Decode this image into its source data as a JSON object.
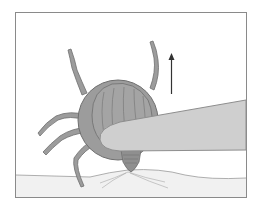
{
  "illustration": {
    "subject": "tick-removal-with-tweezers",
    "elements": [
      "frame",
      "skin-surface",
      "tick",
      "tweezers",
      "pull-direction-arrow"
    ],
    "colors": {
      "background": "#ffffff",
      "frame_border": "#8a8a8a",
      "skin": "#f1f1f1",
      "skin_line": "#9a9a9a",
      "tick_body": "#9c9c9c",
      "tick_outline": "#6e6e6e",
      "tweezers": "#cfcfcf",
      "tweezers_outline": "#8e8e8e",
      "arrow": "#333333"
    },
    "arrow_direction": "up"
  }
}
